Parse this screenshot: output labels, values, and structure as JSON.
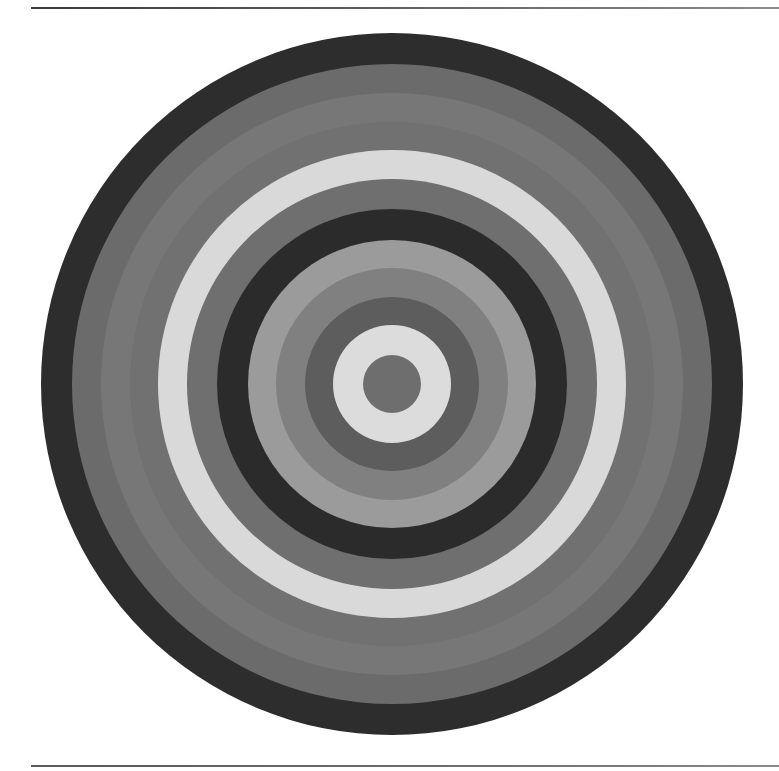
{
  "figure": {
    "center": {
      "x": 392,
      "y": 384
    },
    "rings": [
      {
        "radius": 351,
        "color": "#2d2d2d"
      },
      {
        "radius": 320,
        "color": "#6b6b6b"
      },
      {
        "radius": 291,
        "color": "#777777"
      },
      {
        "radius": 262,
        "color": "#717171"
      },
      {
        "radius": 234,
        "color": "#d9d9d9"
      },
      {
        "radius": 205,
        "color": "#6f6f6f"
      },
      {
        "radius": 175,
        "color": "#2b2b2b"
      },
      {
        "radius": 144,
        "color": "#9b9b9b"
      },
      {
        "radius": 116,
        "color": "#808080"
      },
      {
        "radius": 87,
        "color": "#5d5d5d"
      },
      {
        "radius": 59,
        "color": "#dcdcdc"
      },
      {
        "radius": 29,
        "color": "#6e6e6e"
      }
    ]
  },
  "rules": {
    "top_y": 7,
    "bottom_y": 765
  }
}
